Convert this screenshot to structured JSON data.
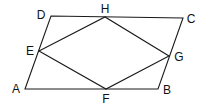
{
  "diagram": {
    "type": "geometry",
    "stroke_color": "#1a1a1a",
    "label_color": "#111111",
    "points": {
      "A": {
        "label": "A",
        "x": 25,
        "y": 89,
        "lx": 16,
        "ly": 89
      },
      "B": {
        "label": "B",
        "x": 158,
        "y": 89,
        "lx": 167,
        "ly": 90
      },
      "C": {
        "label": "C",
        "x": 183,
        "y": 18,
        "lx": 191,
        "ly": 19
      },
      "D": {
        "label": "D",
        "x": 51,
        "y": 16,
        "lx": 41,
        "ly": 15
      },
      "E": {
        "label": "E",
        "x": 39,
        "y": 51,
        "lx": 30,
        "ly": 51
      },
      "F": {
        "label": "F",
        "x": 106,
        "y": 89,
        "lx": 106,
        "ly": 99
      },
      "G": {
        "label": "G",
        "x": 169,
        "y": 56,
        "lx": 179,
        "ly": 57
      },
      "H": {
        "label": "H",
        "x": 105,
        "y": 17,
        "lx": 105,
        "ly": 9
      }
    },
    "outer_shape": {
      "name": "ABCD",
      "vertices": [
        "A",
        "B",
        "C",
        "D"
      ]
    },
    "inner_shape": {
      "name": "EFGH",
      "vertices": [
        "E",
        "F",
        "G",
        "H"
      ]
    }
  }
}
